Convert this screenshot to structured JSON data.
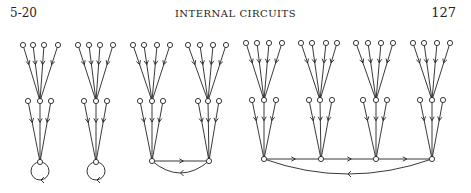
{
  "header": {
    "section": "5-20",
    "title": "INTERNAL CIRCUITS",
    "page_number": "127"
  },
  "figure": {
    "stroke_color": "#222222",
    "node_radius": 2.6,
    "trees": [
      {
        "top": [
          [
            23,
            45
          ],
          [
            33,
            45
          ],
          [
            44,
            45
          ],
          [
            58,
            45
          ]
        ],
        "mid": [
          [
            28,
            101
          ],
          [
            40,
            101
          ],
          [
            51,
            101
          ]
        ],
        "root": [
          40,
          162
        ]
      },
      {
        "top": [
          [
            78,
            45
          ],
          [
            89,
            45
          ],
          [
            100,
            45
          ],
          [
            113,
            45
          ]
        ],
        "mid": [
          [
            84,
            101
          ],
          [
            96,
            101
          ],
          [
            107,
            101
          ]
        ],
        "root": [
          96,
          162
        ]
      },
      {
        "top": [
          [
            133,
            45
          ],
          [
            144,
            45
          ],
          [
            157,
            45
          ],
          [
            170,
            45
          ]
        ],
        "mid": [
          [
            140,
            101
          ],
          [
            152,
            101
          ],
          [
            163,
            101
          ]
        ],
        "root": [
          152,
          161
        ]
      },
      {
        "top": [
          [
            188,
            45
          ],
          [
            200,
            45
          ],
          [
            213,
            45
          ],
          [
            226,
            45
          ]
        ],
        "mid": [
          [
            198,
            101
          ],
          [
            208,
            101
          ],
          [
            219,
            101
          ]
        ],
        "root": [
          209,
          161
        ]
      },
      {
        "top": [
          [
            246,
            43
          ],
          [
            257,
            43
          ],
          [
            269,
            43
          ],
          [
            282,
            43
          ]
        ],
        "mid": [
          [
            252,
            100
          ],
          [
            264,
            100
          ],
          [
            276,
            100
          ]
        ],
        "root": [
          264,
          159
        ]
      },
      {
        "top": [
          [
            301,
            43
          ],
          [
            312,
            43
          ],
          [
            326,
            43
          ],
          [
            337,
            43
          ]
        ],
        "mid": [
          [
            309,
            100
          ],
          [
            320,
            100
          ],
          [
            332,
            100
          ]
        ],
        "root": [
          321,
          159
        ]
      },
      {
        "top": [
          [
            356,
            43
          ],
          [
            368,
            43
          ],
          [
            381,
            43
          ],
          [
            393,
            43
          ]
        ],
        "mid": [
          [
            363,
            100
          ],
          [
            376,
            100
          ],
          [
            387,
            100
          ]
        ],
        "root": [
          376,
          159
        ]
      },
      {
        "top": [
          [
            413,
            43
          ],
          [
            424,
            43
          ],
          [
            437,
            43
          ],
          [
            450,
            43
          ]
        ],
        "mid": [
          [
            420,
            100
          ],
          [
            432,
            100
          ],
          [
            443,
            100
          ]
        ],
        "root": [
          432,
          159
        ]
      }
    ],
    "self_loops": [
      [
        40,
        171,
        9
      ],
      [
        96,
        171,
        9
      ]
    ],
    "cycle_2": {
      "a": [
        152,
        161
      ],
      "b": [
        209,
        161
      ]
    },
    "cycle_4": [
      [
        264,
        159
      ],
      [
        321,
        159
      ],
      [
        376,
        159
      ],
      [
        432,
        159
      ]
    ]
  }
}
